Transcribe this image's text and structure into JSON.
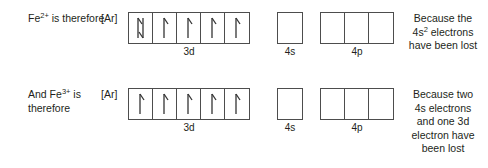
{
  "diagram": {
    "core_label": "[Ar]",
    "orbital_labels": {
      "d": "3d",
      "s": "4s",
      "p": "4p"
    },
    "colors": {
      "box_border": "#4d4d4d",
      "text": "#231f20",
      "background": "#ffffff"
    },
    "rows": [
      {
        "id": "fe2plus",
        "lead_text": "Fe2+ is therefore",
        "lead_parts": {
          "element": "Fe",
          "charge": "2+",
          "tail": " is therefore"
        },
        "core_label": "[Ar]",
        "orbitals": [
          {
            "name": "3d",
            "label": "3d",
            "boxes": [
              {
                "electrons": "up-down"
              },
              {
                "electrons": "up"
              },
              {
                "electrons": "up"
              },
              {
                "electrons": "up"
              },
              {
                "electrons": "up"
              }
            ]
          },
          {
            "name": "4s",
            "label": "4s",
            "boxes": [
              {
                "electrons": "none"
              }
            ]
          },
          {
            "name": "4p",
            "label": "4p",
            "boxes": [
              {
                "electrons": "none"
              },
              {
                "electrons": "none"
              },
              {
                "electrons": "none"
              }
            ]
          }
        ],
        "reason_lines": [
          "Because the",
          "4s2 electrons",
          "have been lost"
        ],
        "reason_text": "Because the 4s2 electrons have been lost"
      },
      {
        "id": "fe3plus",
        "lead_text": "And Fe3+ is therefore",
        "lead_parts": {
          "prefix": "And ",
          "element": "Fe",
          "charge": "3+",
          "tail": " is therefore"
        },
        "core_label": "[Ar]",
        "orbitals": [
          {
            "name": "3d",
            "label": "3d",
            "boxes": [
              {
                "electrons": "up"
              },
              {
                "electrons": "up"
              },
              {
                "electrons": "up"
              },
              {
                "electrons": "up"
              },
              {
                "electrons": "up"
              }
            ]
          },
          {
            "name": "4s",
            "label": "4s",
            "boxes": [
              {
                "electrons": "none"
              }
            ]
          },
          {
            "name": "4p",
            "label": "4p",
            "boxes": [
              {
                "electrons": "none"
              },
              {
                "electrons": "none"
              },
              {
                "electrons": "none"
              }
            ]
          }
        ],
        "reason_lines": [
          "Because two",
          "4s electrons",
          "and one 3d",
          "electron have",
          "been lost"
        ],
        "reason_text": "Because two 4s electrons and one 3d electron have been lost"
      }
    ]
  }
}
